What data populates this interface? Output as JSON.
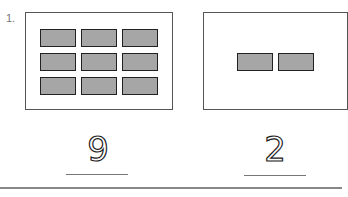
{
  "question": {
    "number": "1.",
    "left_box": {
      "rows": 3,
      "cols": 3,
      "count": 9
    },
    "right_box": {
      "rows": 1,
      "cols": 2,
      "count": 2
    },
    "answers": [
      {
        "text": "9",
        "style": "dotted-trace"
      },
      {
        "text": "2",
        "style": "dotted-trace"
      }
    ]
  },
  "colors": {
    "rect_fill": "#a6a6a6",
    "rect_border": "#222222",
    "box_border": "#555555"
  }
}
